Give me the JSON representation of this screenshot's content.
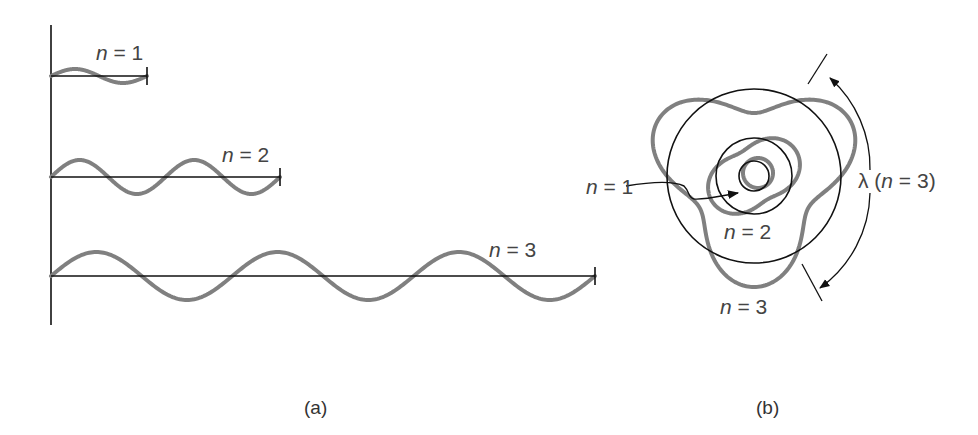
{
  "colors": {
    "wave": "#808080",
    "line": "#111111",
    "text": "#444444",
    "background": "#ffffff"
  },
  "panel_a": {
    "caption": "(a)",
    "axis": {
      "x": 51,
      "y_top": 25,
      "y_bottom": 325
    },
    "waves": [
      {
        "n": "1",
        "label_var": "n",
        "label_eq": " = 1",
        "baseline_y": 76,
        "x_start": 51,
        "x_end": 147,
        "wavelengths": 1,
        "amplitude": 7
      },
      {
        "n": "2",
        "label_var": "n",
        "label_eq": " = 2",
        "baseline_y": 177,
        "x_start": 51,
        "x_end": 280,
        "wavelengths": 2,
        "amplitude": 17
      },
      {
        "n": "3",
        "label_var": "n",
        "label_eq": " = 3",
        "baseline_y": 276,
        "x_start": 51,
        "x_end": 595,
        "wavelengths": 3,
        "amplitude": 24
      }
    ]
  },
  "panel_b": {
    "caption": "(b)",
    "center": {
      "x": 754,
      "y": 176
    },
    "orbits": [
      {
        "n": 1,
        "radius": 15,
        "wave_amplitude": 0,
        "offset_x": 4,
        "offset_y": -3,
        "label_var": "n",
        "label_eq": " = 1"
      },
      {
        "n": 2,
        "radius": 38,
        "wave_amplitude": 11,
        "phase_deg": -30,
        "label_var": "n",
        "label_eq": " = 2"
      },
      {
        "n": 3,
        "radius": 87,
        "wave_amplitude": 24,
        "phase_deg": 90,
        "label_var": "n",
        "label_eq": " = 3"
      }
    ],
    "wavelength_label": {
      "symbol": "λ",
      "open": " (",
      "var": "n",
      "eq": " = 3)"
    }
  }
}
